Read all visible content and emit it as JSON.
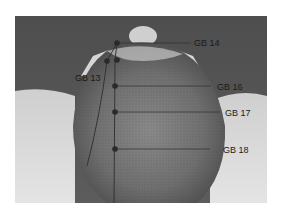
{
  "figure": {
    "points": [
      {
        "id": "gb14",
        "label": "GB 14"
      },
      {
        "id": "gb13",
        "label": "GB 13"
      },
      {
        "id": "gb16",
        "label": "GB 16"
      },
      {
        "id": "gb17",
        "label": "GB 17"
      },
      {
        "id": "gb18",
        "label": "GB 18"
      }
    ],
    "colors": {
      "background": "#5a5a5a",
      "skin_light": "#d8d8d8",
      "hair": "#6e6e6e",
      "marker": "#2a2a2a",
      "line": "#2e2e2e"
    }
  }
}
